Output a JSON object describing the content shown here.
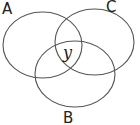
{
  "diagram": {
    "type": "venn",
    "stroke_color": "#555555",
    "sets": [
      {
        "name": "A",
        "label": "A",
        "cx": 42.5,
        "cy": 45,
        "rx": 39.5,
        "ry": 33,
        "label_x": 2,
        "label_y": 14
      },
      {
        "name": "C",
        "label": "C",
        "cx": 94.5,
        "cy": 42,
        "rx": 39.5,
        "ry": 33,
        "label_x": 106,
        "label_y": 12
      },
      {
        "name": "B",
        "label": "B",
        "cx": 75,
        "cy": 74,
        "rx": 40,
        "ry": 33,
        "label_x": 63,
        "label_y": 123
      }
    ],
    "regions": [
      {
        "name": "A∩B∩C",
        "label": "y",
        "x": 63,
        "y": 58
      }
    ]
  }
}
